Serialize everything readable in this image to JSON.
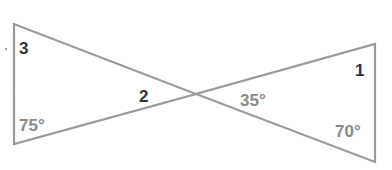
{
  "diagram": {
    "line_color": "#9a9a9a",
    "label_color_number": "#333333",
    "label_color_degree": "#8a8a8a",
    "left_triangle": {
      "vertices": {
        "top": [
          14,
          24
        ],
        "bottom": [
          14,
          144
        ],
        "apex": [
          196,
          94
        ]
      },
      "labels": [
        {
          "id": "angle-3",
          "text": "3",
          "x": 19,
          "y": 54,
          "kind": "number"
        },
        {
          "id": "angle-2",
          "text": "2",
          "x": 139,
          "y": 102,
          "kind": "number"
        },
        {
          "id": "angle-75",
          "text": "75°",
          "x": 19,
          "y": 131,
          "kind": "degree"
        }
      ]
    },
    "right_triangle": {
      "vertices": {
        "top": [
          375,
          44
        ],
        "bottom": [
          375,
          162
        ],
        "apex": [
          196,
          94
        ]
      },
      "labels": [
        {
          "id": "angle-1",
          "text": "1",
          "x": 355,
          "y": 76,
          "kind": "number"
        },
        {
          "id": "angle-35",
          "text": "35°",
          "x": 240,
          "y": 106,
          "kind": "degree"
        },
        {
          "id": "angle-70",
          "text": "70°",
          "x": 335,
          "y": 137,
          "kind": "degree"
        }
      ]
    },
    "stray_dot": [
      6,
      49
    ]
  }
}
